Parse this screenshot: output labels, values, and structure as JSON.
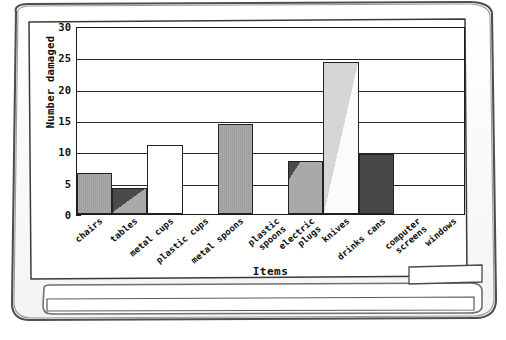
{
  "frame": {
    "device_name": "hand-drawn-tablet-frame",
    "tray_name": "tray-ledge"
  },
  "chart_data": {
    "type": "bar",
    "title": "Frequency of damage",
    "xlabel": "Items",
    "ylabel": "Number damaged",
    "ylim": [
      0,
      30
    ],
    "yticks": [
      0,
      5,
      10,
      15,
      20,
      25,
      30
    ],
    "grid": true,
    "legend": "none",
    "categories": [
      "chairs",
      "tables",
      "metal cups",
      "plastic cups",
      "metal spoons",
      "plastic spoons",
      "electric plugs",
      "knives",
      "drinks cans",
      "computer screens",
      "windows"
    ],
    "values": [
      6.5,
      4.2,
      11,
      0,
      14.3,
      0,
      8.4,
      24.3,
      9.6,
      0,
      0
    ],
    "bar_styles": [
      "mid-gray",
      "diagonal-dark-gray",
      "white",
      "empty",
      "mid-gray",
      "empty",
      "diagonal-dark-gray-small",
      "diagonal-light-white",
      "dark-solid",
      "empty",
      "empty"
    ]
  },
  "colors": {
    "mid_gray": "#a9a9a9",
    "light_gray": "#d6d6d6",
    "dark_gray": "#4a4a4a",
    "white": "#ffffff",
    "axis": "#1c1c1c",
    "ink": "#0d0d0d"
  },
  "xlabels_wrapped": [
    [
      "chairs"
    ],
    [
      "tables"
    ],
    [
      "metal cups"
    ],
    [
      "plastic cups"
    ],
    [
      "metal spoons"
    ],
    [
      "plastic",
      "spoons"
    ],
    [
      "electric",
      "plugs"
    ],
    [
      "knives"
    ],
    [
      "drinks cans"
    ],
    [
      "computer",
      "screens"
    ],
    [
      "windows"
    ]
  ]
}
